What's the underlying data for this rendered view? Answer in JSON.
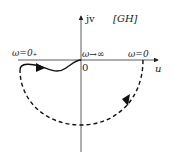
{
  "diagram": {
    "title": "[GH]",
    "axes": {
      "vertical_label": "jv",
      "horizontal_label": "u",
      "origin_label": "0"
    },
    "annotations": {
      "left_start": "ω=0₊",
      "origin_limit": "ω→∞",
      "right_point": "ω=0"
    },
    "curves": [
      {
        "name": "solid-nyquist-curve",
        "style": "solid",
        "from": "ω=0₊",
        "to": "origin (ω→∞)"
      },
      {
        "name": "dashed-infinite-arc",
        "style": "dashed",
        "from": "ω=0",
        "to": "ω=0₊",
        "direction": "clockwise"
      }
    ],
    "colors": {
      "stroke": "#222222",
      "background": "#ffffff"
    }
  }
}
